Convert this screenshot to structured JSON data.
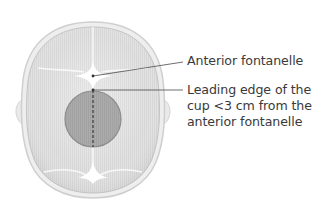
{
  "figure": {
    "colors": {
      "skull_fill": "#e4e4e4",
      "skull_outline": "#c9c9c9",
      "fontanelle": "#ffffff",
      "cup_fill": "#a9a9a9",
      "cup_outline": "#8a8a8a",
      "leader_line": "#4a4a4a",
      "label_text": "#3a3a3a"
    }
  },
  "labels": {
    "anterior_fontanelle": "Anterior fontanelle",
    "leading_edge": {
      "line1": "Leading edge of the",
      "line2": "cup <3 cm from the",
      "line3": "anterior fontanelle"
    }
  }
}
